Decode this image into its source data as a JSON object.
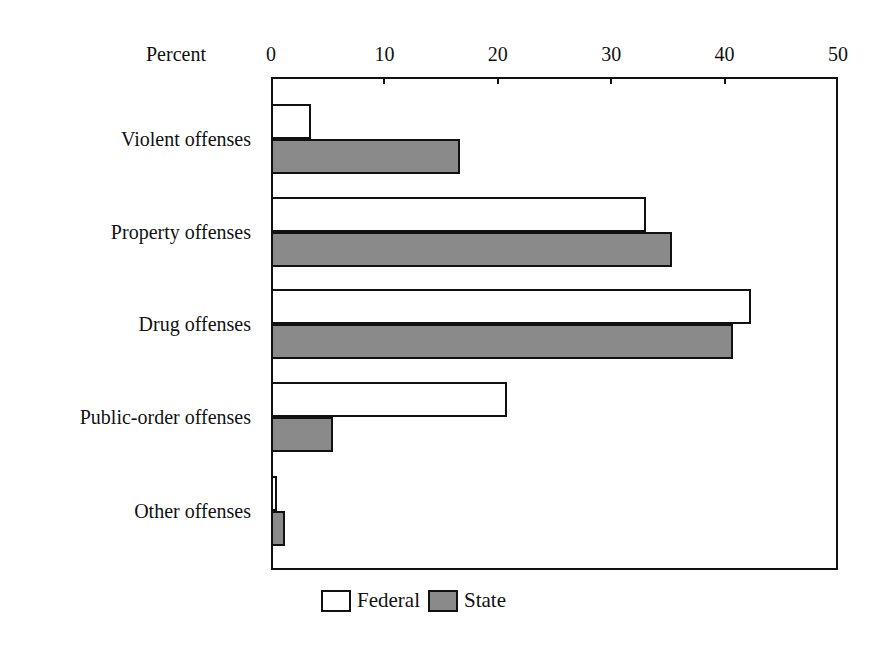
{
  "chart_data": {
    "type": "bar",
    "orientation": "horizontal",
    "title": "",
    "xlabel": "Percent",
    "ylabel": "",
    "xlim": [
      0,
      50
    ],
    "x_ticks": [
      0,
      10,
      20,
      30,
      40,
      50
    ],
    "grid": false,
    "legend_position": "bottom",
    "categories": [
      "Violent offenses",
      "Property offenses",
      "Drug offenses",
      "Public-order offenses",
      "Other offenses"
    ],
    "series": [
      {
        "name": "Federal",
        "color": "#ffffff",
        "values": [
          3.5,
          33.1,
          42.3,
          20.8,
          0.5
        ]
      },
      {
        "name": "State",
        "color": "#8a8a8a",
        "values": [
          16.7,
          35.4,
          40.7,
          5.5,
          1.2
        ]
      }
    ]
  },
  "axis": {
    "title": "Percent",
    "ticks": [
      "0",
      "10",
      "20",
      "30",
      "40",
      "50"
    ]
  },
  "legend": {
    "federal": "Federal",
    "state": "State"
  }
}
